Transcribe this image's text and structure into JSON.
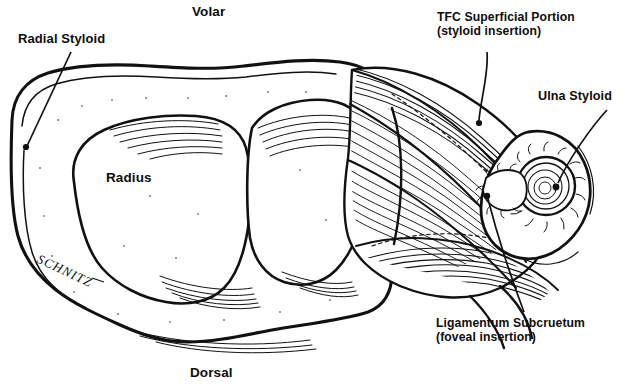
{
  "figure": {
    "kind": "anatomical-line-drawing",
    "background_color": "#ffffff",
    "ink_color": "#111111"
  },
  "orientation": {
    "top_label": "Volar",
    "bottom_label": "Dorsal"
  },
  "labels": {
    "radial_styloid": "Radial Styloid",
    "radius": "Radius",
    "tfc_line1": "TFC Superficial Portion",
    "tfc_line2": "(styloid insertion)",
    "ulna_styloid": "Ulna Styloid",
    "ligament_line1": "Ligamentum Subcruetum",
    "ligament_line2": "(foveal insertion)"
  },
  "signature": {
    "artist": "SCHNITZ"
  }
}
